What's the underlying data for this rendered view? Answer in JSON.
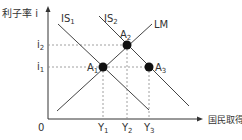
{
  "diagram": {
    "axes": {
      "y_label": "利子率 i",
      "x_label": "国民取得 Y",
      "origin_label": "0"
    },
    "curves": [
      {
        "id": "IS1",
        "label": "IS",
        "sub": "1"
      },
      {
        "id": "IS2",
        "label": "IS",
        "sub": "2"
      },
      {
        "id": "LM",
        "label": "LM",
        "sub": ""
      }
    ],
    "points": [
      {
        "id": "A1",
        "label": "A",
        "sub": "1"
      },
      {
        "id": "A2",
        "label": "A",
        "sub": "2"
      },
      {
        "id": "A3",
        "label": "A",
        "sub": "3"
      }
    ],
    "y_ticks": [
      {
        "label": "i",
        "sub": "2"
      },
      {
        "label": "i",
        "sub": "1"
      }
    ],
    "x_ticks": [
      {
        "label": "Y",
        "sub": "1"
      },
      {
        "label": "Y",
        "sub": "2"
      },
      {
        "label": "Y",
        "sub": "3"
      }
    ],
    "colors": {
      "line": "#444444",
      "point": "#111111",
      "guide": "#888888"
    }
  }
}
